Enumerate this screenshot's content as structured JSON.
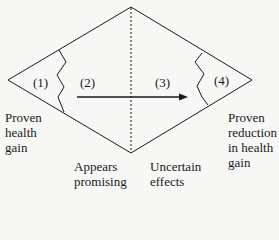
{
  "diagram": {
    "regions": [
      {
        "id": "1",
        "label": "(1)"
      },
      {
        "id": "2",
        "label": "(2)"
      },
      {
        "id": "3",
        "label": "(3)"
      },
      {
        "id": "4",
        "label": "(4)"
      }
    ],
    "captions": {
      "left": "Proven\nhealth\ngain",
      "bottom_left": "Appears\npromising",
      "bottom_right": "Uncertain\neffects",
      "right": "Proven\nreduction\nin health\ngain"
    },
    "colors": {
      "line": "#1a1a1a",
      "background": "#f7f7f5"
    }
  }
}
